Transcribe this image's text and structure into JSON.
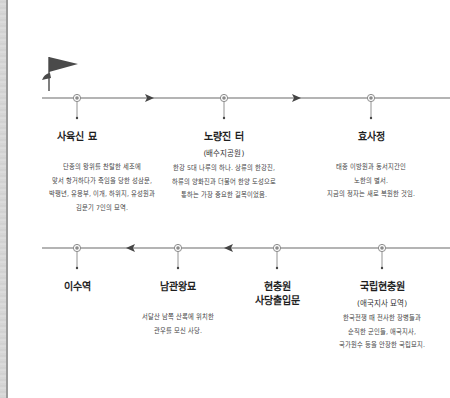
{
  "diagram": {
    "type": "route-timeline",
    "start_marker": "flag-icon",
    "colors": {
      "line": "#6b6b6b",
      "node": "#8a8a8a",
      "flag": "#4a4a4a",
      "text": "#1e1e1e"
    },
    "top_row": {
      "direction": "right",
      "stops": [
        {
          "title": "사육신 묘",
          "subtitle": "",
          "desc": [
            "단종의 왕위를 찬탈한 세조에",
            "맞서 항거하다가 죽임을 당한 성삼문,",
            "박팽년, 유응부, 이개, 하위지, 유성원과",
            "김문기 7인의 묘역."
          ]
        },
        {
          "title": "노량진 터",
          "subtitle": "(배수지공원)",
          "desc": [
            "한강 5대 나루의 하나. 상류의 한강진,",
            "하류의 양화진과 더불어 한양 도성으로",
            "통하는 가장 중요한 길목이었음."
          ]
        },
        {
          "title": "효사정",
          "subtitle": "",
          "desc": [
            "태종 이방원과 동서지간인",
            "노한의 별서.",
            "지금의 정자는 새로 복원한 것임."
          ]
        }
      ]
    },
    "bottom_row": {
      "direction": "left",
      "stops": [
        {
          "title": "이수역",
          "subtitle": "",
          "desc": []
        },
        {
          "title": "남관왕묘",
          "subtitle": "",
          "desc": [
            "서달산 남쪽 산록에 위치한",
            "관우를 모신 사당."
          ]
        },
        {
          "title_lines": [
            "현충원",
            "사당출입문"
          ],
          "desc": []
        },
        {
          "title": "국립현충원",
          "subtitle": "(애국지사 묘역)",
          "desc": [
            "한국전쟁 때 전사한 장병들과",
            "순직한 군인들, 애국지사,",
            "국가원수 등을 안장한 국립묘지."
          ]
        }
      ]
    }
  }
}
